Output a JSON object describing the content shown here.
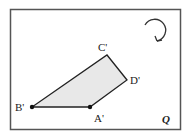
{
  "diagram": {
    "region_label": "Q",
    "points": [
      {
        "label": "A'",
        "x": 90,
        "y": 107
      },
      {
        "label": "B'",
        "x": 32,
        "y": 107
      },
      {
        "label": "C'",
        "x": 107,
        "y": 55
      },
      {
        "label": "D'",
        "x": 127,
        "y": 80
      }
    ],
    "rotation_direction": "clockwise",
    "colors": {
      "fill": "#e8e8e8",
      "stroke": "#222222",
      "frame": "#555555"
    }
  }
}
